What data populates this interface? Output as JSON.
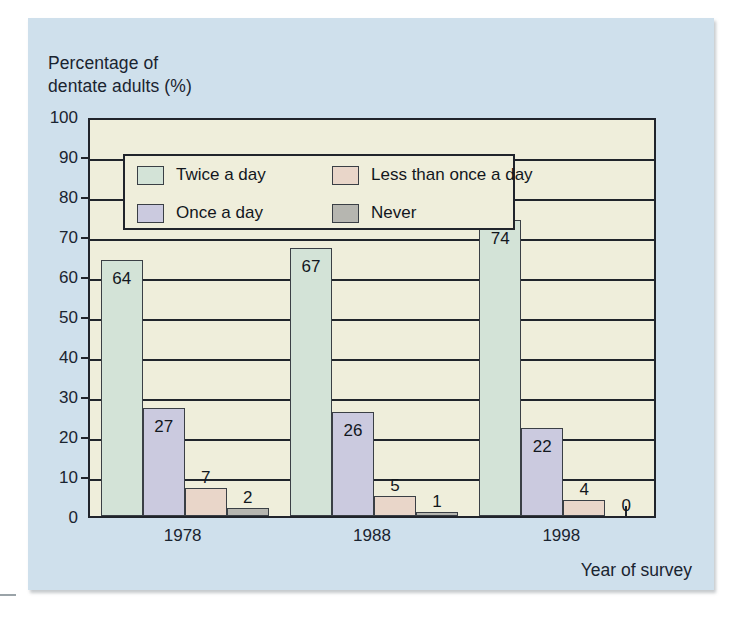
{
  "chart_data": {
    "type": "bar",
    "title": "",
    "ylabel": "Percentage of dentate adults (%)",
    "xlabel": "Year of survey",
    "categories": [
      "1978",
      "1988",
      "1998"
    ],
    "series": [
      {
        "name": "Twice a day",
        "color": "#d3e3d7",
        "values": [
          64,
          67,
          74
        ]
      },
      {
        "name": "Once a day",
        "color": "#cbcadf",
        "values": [
          27,
          26,
          22
        ]
      },
      {
        "name": "Less than once a day",
        "color": "#e9d6c9",
        "values": [
          7,
          5,
          4
        ]
      },
      {
        "name": "Never",
        "color": "#b6b6b0",
        "values": [
          2,
          1,
          0
        ]
      }
    ],
    "ylim": [
      0,
      100
    ],
    "yticks": [
      0,
      10,
      20,
      30,
      40,
      50,
      60,
      70,
      80,
      90,
      100
    ],
    "ytick_labels": [
      "0",
      "10",
      "20",
      "30",
      "40",
      "50",
      "60",
      "70",
      "80",
      "90",
      "100"
    ],
    "grid": true,
    "legend_position": "upper-left-inside",
    "data_labels": true,
    "colors": {
      "panel_background": "#cfe0ec",
      "plot_background": "#efeedb",
      "axis_line": "#20242b",
      "text": "#1a2430"
    }
  },
  "axis_titles": {
    "y_line1": "Percentage of",
    "y_line2": "dentate adults (%)",
    "x": "Year of survey"
  }
}
